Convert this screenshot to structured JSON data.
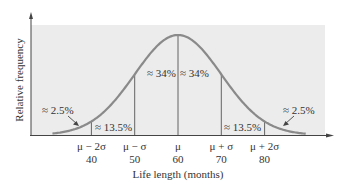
{
  "chart_data": {
    "type": "line",
    "title": "",
    "xlabel": "Life length (months)",
    "ylabel": "Relative frequency",
    "distribution": "normal",
    "mean": 60,
    "std_dev": 10,
    "xlim": [
      28,
      92
    ],
    "grid": false,
    "legend": "none",
    "x_ticks": [
      {
        "symbol": "μ − 2σ",
        "value": 40
      },
      {
        "symbol": "μ − σ",
        "value": 50
      },
      {
        "symbol": "μ",
        "value": 60
      },
      {
        "symbol": "μ + σ",
        "value": 70
      },
      {
        "symbol": "μ + 2σ",
        "value": 80
      }
    ],
    "regions": [
      {
        "from": null,
        "to": 40,
        "label": "≈ 2.5%",
        "percent": 2.5
      },
      {
        "from": 40,
        "to": 50,
        "label": "≈ 13.5%",
        "percent": 13.5
      },
      {
        "from": 50,
        "to": 60,
        "label": "≈ 34%",
        "percent": 34
      },
      {
        "from": 60,
        "to": 70,
        "label": "≈ 34%",
        "percent": 34
      },
      {
        "from": 70,
        "to": 80,
        "label": "≈ 13.5%",
        "percent": 13.5
      },
      {
        "from": 80,
        "to": null,
        "label": "≈ 2.5%",
        "percent": 2.5
      }
    ]
  },
  "colors": {
    "panel": "#ececec",
    "curve": "#8a8a8a",
    "axis": "#444444",
    "divider": "#555555",
    "text": "#333333"
  }
}
